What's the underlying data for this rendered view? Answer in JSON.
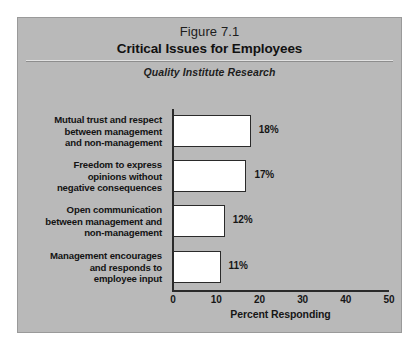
{
  "figure": {
    "number": "Figure 7.1",
    "title": "Critical Issues for Employees",
    "subtitle": "Quality Institute Research"
  },
  "colors": {
    "panel_background": "#b9b9b9",
    "page_background": "#ffffff",
    "bar_fill": "#ffffff",
    "bar_border": "#2a2a2a",
    "axis": "#2a2a2a",
    "text": "#131313"
  },
  "chart_data": {
    "type": "bar",
    "orientation": "horizontal",
    "title": "Critical Issues for Employees",
    "subtitle": "Quality Institute Research",
    "categories": [
      "Mutual trust and respect between management and non-management",
      "Freedom to express opinions without negative consequences",
      "Open communication between management and non-management",
      "Management encourages and responds to employee input"
    ],
    "category_lines": [
      [
        "Mutual trust and respect",
        "between management",
        "and non-management"
      ],
      [
        "Freedom to express",
        "opinions without",
        "negative consequences"
      ],
      [
        "Open communication",
        "between management and",
        "non-management"
      ],
      [
        "Management encourages",
        "and responds to",
        "employee input"
      ]
    ],
    "values": [
      18,
      17,
      12,
      11
    ],
    "value_labels": [
      "18%",
      "17%",
      "12%",
      "11%"
    ],
    "xlabel": "Percent Responding",
    "ylabel": "",
    "xlim": [
      0,
      50
    ],
    "xticks": [
      0,
      10,
      20,
      30,
      40,
      50
    ],
    "xtick_labels": [
      "0",
      "10",
      "20",
      "30",
      "40",
      "50"
    ],
    "grid": false,
    "legend": false
  }
}
